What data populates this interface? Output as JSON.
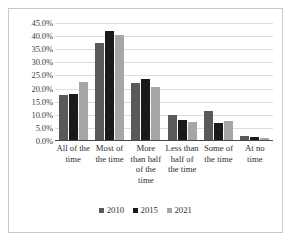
{
  "chart_data": {
    "type": "bar",
    "title": "",
    "xlabel": "",
    "ylabel": "",
    "ylim": [
      0,
      45
    ],
    "grid": true,
    "legend_position": "bottom",
    "categories": [
      "All of the time",
      "Most of the time",
      "More than half of the time",
      "Less than half of the time",
      "Some of the time",
      "At no time"
    ],
    "ytick_labels": [
      "45.0%",
      "40.0%",
      "35.0%",
      "30.0%",
      "25.0%",
      "20.0%",
      "15.0%",
      "10.0%",
      "5.0%",
      "0.0%"
    ],
    "ytick_values": [
      45,
      40,
      35,
      30,
      25,
      20,
      15,
      10,
      5,
      0
    ],
    "series": [
      {
        "name": "2010",
        "color": "#595959",
        "values": [
          17.5,
          37.5,
          22.0,
          10.0,
          11.5,
          1.8
        ]
      },
      {
        "name": "2015",
        "color": "#1a1a1a",
        "values": [
          18.0,
          42.0,
          23.5,
          8.2,
          7.0,
          1.7
        ]
      },
      {
        "name": "2021",
        "color": "#a6a6a6",
        "values": [
          22.5,
          40.5,
          20.5,
          7.3,
          7.8,
          1.1
        ]
      }
    ]
  }
}
